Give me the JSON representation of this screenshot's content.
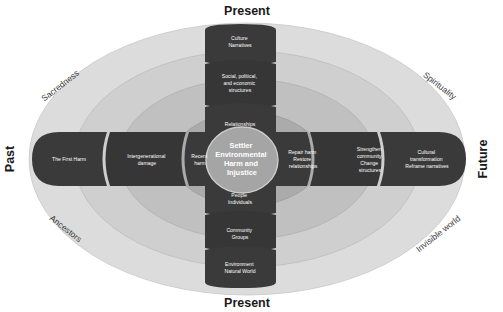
{
  "diagram": {
    "core": {
      "lines": [
        "Settler",
        "Environmental",
        "Harm and",
        "Injustice"
      ]
    },
    "axes": {
      "top": "Present",
      "bottom": "Present",
      "left": "Past",
      "right": "Future"
    },
    "corners": {
      "top_left": "Sacredness",
      "top_right": "Spirituality",
      "bottom_left": "Ancestors",
      "bottom_right": "Invisible world"
    },
    "upper_blocks": [
      {
        "id": "culture-narratives",
        "lines": [
          "Culture",
          "Narratives"
        ]
      },
      {
        "id": "social-political-economic-structures",
        "lines": [
          "Social, political,",
          "and economic",
          "structures"
        ]
      },
      {
        "id": "relationships",
        "lines": [
          "Relationships"
        ]
      }
    ],
    "lower_blocks": [
      {
        "id": "people-individuals",
        "lines": [
          "People",
          "Individuals"
        ]
      },
      {
        "id": "community-groups",
        "lines": [
          "Community",
          "Groups"
        ]
      },
      {
        "id": "environment-natural-world",
        "lines": [
          "Environment",
          "Natural World"
        ]
      }
    ],
    "left_blocks": [
      {
        "id": "the-first-harm",
        "lines": [
          "The First Harm"
        ]
      },
      {
        "id": "intergenerational-damage",
        "lines": [
          "Intergenerational",
          "damage"
        ]
      },
      {
        "id": "recent-harm",
        "lines": [
          "Recent",
          "harm"
        ]
      }
    ],
    "right_blocks": [
      {
        "id": "repair-harm-restore-relationships",
        "lines": [
          "Repair harm",
          "Restore",
          "relationships"
        ]
      },
      {
        "id": "strengthen-community-change-structures",
        "lines": [
          "Strengthen",
          "community",
          "Change",
          "structures"
        ]
      },
      {
        "id": "cultural-transformation-reframe-narratives",
        "lines": [
          "Cultural",
          "transformation",
          "Reframe narratives"
        ]
      }
    ],
    "colors": {
      "background": "#ffffff",
      "ring_outer": "#dcdcdc",
      "ring_second": "#cfcfcf",
      "ring_third": "#bfbfbf",
      "ring_inner": "#ababab",
      "block_dark": "#383838",
      "block_dark_alt": "#343434",
      "core_fill": "#a8a8a8",
      "text_light": "#ffffff",
      "text_dark": "#1a1a1a"
    }
  }
}
